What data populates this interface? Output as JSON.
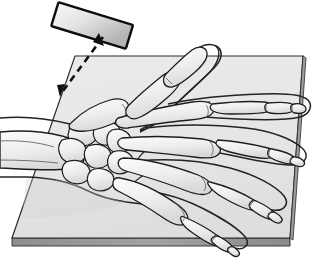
{
  "figure": {
    "title": "Hand radiographic positioning - PA projection",
    "view": "posteroanterior",
    "background_color": "#ffffff",
    "line_color": "#1a1a1a"
  },
  "cassette": {
    "name": "x-ray cassette platform",
    "surface_color": "#e9e9e9",
    "surface_shade_color": "#dddddd",
    "edge_color": "#9b9b9b",
    "edge_dark_color": "#8a8a8a",
    "outline_color": "#2a2a2a",
    "top_left": [
      75,
      56
    ],
    "top_right": [
      303,
      56
    ],
    "bottom_right": [
      290,
      238
    ],
    "bottom_left": [
      12,
      238
    ],
    "front_edge_height": 8
  },
  "tube": {
    "name": "x-ray tube collimator block",
    "label": "",
    "fill_light": "#f2f2f2",
    "fill_dark": "#b9b9b9",
    "outline_color": "#111111",
    "angle_deg": 17,
    "center": [
      92,
      26
    ],
    "width": 78,
    "height": 24
  },
  "beam": {
    "name": "central ray",
    "style": "dashed",
    "color": "#111111",
    "dash": "7,5",
    "width": 2.6,
    "start": [
      103,
      37
    ],
    "end": [
      59,
      96
    ],
    "arrowheads": 2
  },
  "anatomy": {
    "forearm": {
      "name": "distal forearm soft tissue"
    },
    "radius_ulna": {
      "name": "radius and ulna"
    },
    "carpals": {
      "name": "carpal bones",
      "count": 8,
      "fill": "#f0f0f0"
    },
    "metacarpals": {
      "name": "metacarpal bones",
      "count": 5,
      "fill": "#f0f0f0"
    },
    "phalanges": {
      "name": "phalanges",
      "fill": "#f0f0f0",
      "digits": [
        "thumb",
        "index",
        "middle",
        "ring",
        "little"
      ]
    },
    "soft_tissue_outline": {
      "name": "hand soft tissue outline",
      "fill": "#ffffff"
    }
  },
  "palette": {
    "bone_fill": "#f1f1f1",
    "bone_shade": "#d8d8d8",
    "bone_line": "#1d1d1d",
    "skin_fill": "#fefefe",
    "skin_line": "#222222"
  }
}
